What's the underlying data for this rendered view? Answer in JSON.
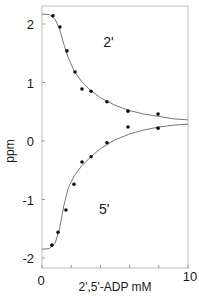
{
  "chart_data": {
    "type": "scatter",
    "title": "",
    "xlabel": "2',5'-ADP  mM",
    "ylabel": "ppm",
    "xlim": [
      0,
      10
    ],
    "ylim": [
      -2.2,
      2.2
    ],
    "x_ticks": [
      0,
      2,
      4,
      6,
      8,
      10
    ],
    "x_tick_labels": [
      "0",
      "",
      "",
      "",
      "",
      "10"
    ],
    "y_ticks": [
      -2,
      -1,
      0,
      1,
      2
    ],
    "y_tick_labels": [
      "-2",
      "-1",
      "0",
      "1",
      "2"
    ],
    "grid": false,
    "legend": null,
    "annotations": [
      {
        "text": "2'",
        "x": 4.2,
        "y": 1.6
      },
      {
        "text": "5'",
        "x": 3.9,
        "y": -1.25
      }
    ],
    "series": [
      {
        "name": "2'",
        "points": [
          [
            0.75,
            2.14
          ],
          [
            1.23,
            1.95
          ],
          [
            1.71,
            1.54
          ],
          [
            2.26,
            1.18
          ],
          [
            2.74,
            0.89
          ],
          [
            3.36,
            0.85
          ],
          [
            4.45,
            0.67
          ],
          [
            5.89,
            0.51
          ],
          [
            7.95,
            0.46
          ]
        ],
        "fit_curve": [
          [
            0,
            2.17
          ],
          [
            0.5,
            2.16
          ],
          [
            0.9,
            2.08
          ],
          [
            1.2,
            1.92
          ],
          [
            1.5,
            1.65
          ],
          [
            1.8,
            1.42
          ],
          [
            2.2,
            1.2
          ],
          [
            2.7,
            1.02
          ],
          [
            3.3,
            0.87
          ],
          [
            4.0,
            0.74
          ],
          [
            5.0,
            0.61
          ],
          [
            6.0,
            0.52
          ],
          [
            7.0,
            0.46
          ],
          [
            8.0,
            0.42
          ],
          [
            9.0,
            0.38
          ],
          [
            10.0,
            0.36
          ]
        ]
      },
      {
        "name": "5'",
        "points": [
          [
            0.68,
            -1.78
          ],
          [
            1.1,
            -1.56
          ],
          [
            1.64,
            -1.18
          ],
          [
            2.19,
            -0.74
          ],
          [
            2.74,
            -0.36
          ],
          [
            3.36,
            -0.27
          ],
          [
            4.45,
            -0.03
          ],
          [
            5.89,
            0.24
          ],
          [
            7.95,
            0.22
          ]
        ],
        "fit_curve": [
          [
            0,
            -1.85
          ],
          [
            0.5,
            -1.84
          ],
          [
            0.9,
            -1.75
          ],
          [
            1.2,
            -1.5
          ],
          [
            1.5,
            -1.1
          ],
          [
            1.8,
            -0.8
          ],
          [
            2.2,
            -0.6
          ],
          [
            2.7,
            -0.43
          ],
          [
            3.3,
            -0.28
          ],
          [
            4.0,
            -0.13
          ],
          [
            5.0,
            0.02
          ],
          [
            6.0,
            0.12
          ],
          [
            7.0,
            0.19
          ],
          [
            8.0,
            0.24
          ],
          [
            9.0,
            0.27
          ],
          [
            10.0,
            0.29
          ]
        ]
      }
    ]
  }
}
